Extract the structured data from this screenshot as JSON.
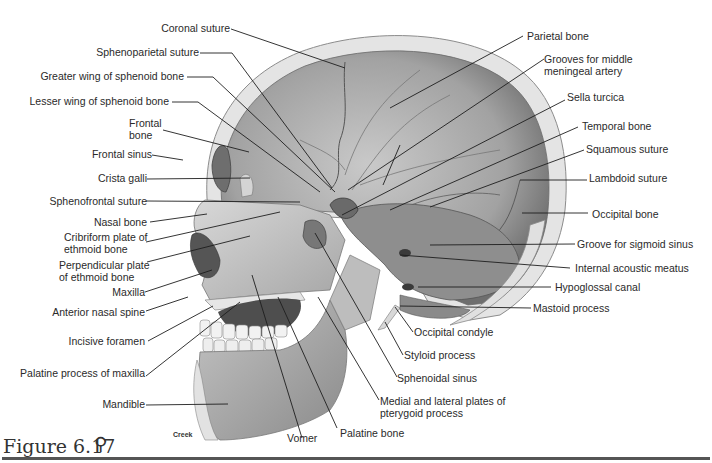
{
  "figure": {
    "caption": "Figure 6.17",
    "icon": "anatomy-figure-icon",
    "icon_glyph": "⚲",
    "artist_credit": "Creek"
  },
  "diagram": {
    "labels_left": [
      {
        "id": "coronal-suture",
        "text": "Coronal suture"
      },
      {
        "id": "sphenoparietal-suture",
        "text": "Sphenoparietal suture"
      },
      {
        "id": "greater-wing-sphenoid",
        "text": "Greater wing of sphenoid bone"
      },
      {
        "id": "lesser-wing-sphenoid",
        "text": "Lesser wing of sphenoid bone"
      },
      {
        "id": "frontal-bone",
        "line1": "Frontal",
        "line2": "bone"
      },
      {
        "id": "frontal-sinus",
        "text": "Frontal sinus"
      },
      {
        "id": "crista-galli",
        "text": "Crista galli"
      },
      {
        "id": "sphenofrontal-suture",
        "text": "Sphenofrontal suture"
      },
      {
        "id": "nasal-bone",
        "text": "Nasal bone"
      },
      {
        "id": "cribriform-plate",
        "line1": "Cribriform plate of",
        "line2": "ethmoid bone"
      },
      {
        "id": "perpendicular-plate",
        "line1": "Perpendicular plate",
        "line2": "of ethmoid bone"
      },
      {
        "id": "maxilla",
        "text": "Maxilla"
      },
      {
        "id": "anterior-nasal-spine",
        "text": "Anterior nasal spine"
      },
      {
        "id": "incisive-foramen",
        "text": "Incisive foramen"
      },
      {
        "id": "palatine-process-maxilla",
        "text": "Palatine process of maxilla"
      },
      {
        "id": "mandible",
        "text": "Mandible"
      }
    ],
    "labels_right": [
      {
        "id": "parietal-bone",
        "text": "Parietal bone"
      },
      {
        "id": "grooves-middle-meningeal",
        "line1": "Grooves for middle",
        "line2": "meningeal artery"
      },
      {
        "id": "sella-turcica",
        "text": "Sella turcica"
      },
      {
        "id": "temporal-bone",
        "text": "Temporal bone"
      },
      {
        "id": "squamous-suture",
        "text": "Squamous suture"
      },
      {
        "id": "lambdoid-suture",
        "text": "Lambdoid suture"
      },
      {
        "id": "occipital-bone",
        "text": "Occipital bone"
      },
      {
        "id": "groove-sigmoid-sinus",
        "text": "Groove for sigmoid sinus"
      },
      {
        "id": "internal-acoustic-meatus",
        "text": "Internal acoustic meatus"
      },
      {
        "id": "hypoglossal-canal",
        "text": "Hypoglossal canal"
      },
      {
        "id": "mastoid-process",
        "text": "Mastoid process"
      }
    ],
    "labels_bottom": [
      {
        "id": "occipital-condyle",
        "text": "Occipital condyle"
      },
      {
        "id": "styloid-process",
        "text": "Styloid process"
      },
      {
        "id": "sphenoidal-sinus",
        "text": "Sphenoidal sinus"
      },
      {
        "id": "pterygoid-plates",
        "line1": "Medial and lateral plates of",
        "line2": "pterygoid process"
      },
      {
        "id": "palatine-bone",
        "text": "Palatine bone"
      },
      {
        "id": "vomer",
        "text": "Vomer"
      }
    ]
  },
  "colors": {
    "background": "#ffffff",
    "bone_light": "#e2e2e2",
    "bone_mid": "#b4b4b4",
    "bone_dark": "#7a7a7a",
    "cavity": "#5a5a5a",
    "leader_line": "#1e1e1e",
    "text": "#2a2a2a"
  }
}
